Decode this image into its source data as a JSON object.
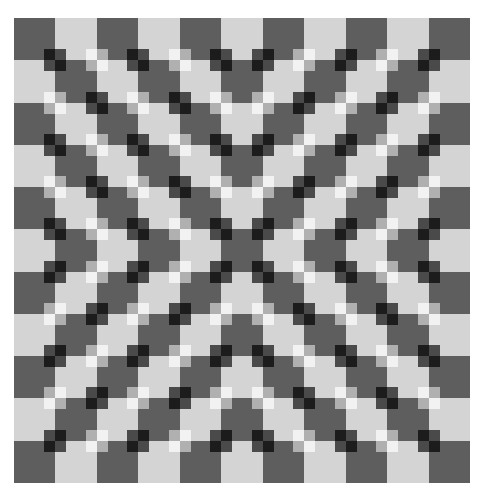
{
  "title": "Bulging checkerboard optical illusion",
  "board": {
    "rows": 11,
    "cols": 11,
    "top_left_tile": "dark",
    "colors": {
      "background": "#ffffff",
      "dark_tile": "#5e5e5e",
      "light_tile": "#d4d4d4",
      "dark_strong": "#1c1c1c",
      "dark_weak": "#4a4a4a",
      "light_strong": "#f2f2f2",
      "light_weak": "#b0b0b0"
    },
    "mini_square_px": 11,
    "intersection_orientation": [
      [
        "\\",
        "\\",
        "\\",
        "\\",
        "\\",
        "/",
        "/",
        "/",
        "/",
        "/"
      ],
      [
        "\\",
        "\\",
        "\\",
        "\\",
        "\\",
        "/",
        "/",
        "/",
        "/",
        "/"
      ],
      [
        "\\",
        "\\",
        "\\",
        "\\",
        "\\",
        "/",
        "/",
        "/",
        "/",
        "/"
      ],
      [
        "\\",
        "\\",
        "\\",
        "\\",
        "\\",
        "/",
        "/",
        "/",
        "/",
        "/"
      ],
      [
        "\\",
        "\\",
        "\\",
        "\\",
        "\\",
        "/",
        "/",
        "/",
        "/",
        "/"
      ],
      [
        "/",
        "/",
        "/",
        "/",
        "/",
        "\\",
        "\\",
        "\\",
        "\\",
        "\\"
      ],
      [
        "/",
        "/",
        "/",
        "/",
        "/",
        "\\",
        "\\",
        "\\",
        "\\",
        "\\"
      ],
      [
        "/",
        "/",
        "/",
        "/",
        "/",
        "\\",
        "\\",
        "\\",
        "\\",
        "\\"
      ],
      [
        "/",
        "/",
        "/",
        "/",
        "/",
        "\\",
        "\\",
        "\\",
        "\\",
        "\\"
      ],
      [
        "/",
        "/",
        "/",
        "/",
        "/",
        "\\",
        "\\",
        "\\",
        "\\",
        "\\"
      ]
    ]
  }
}
